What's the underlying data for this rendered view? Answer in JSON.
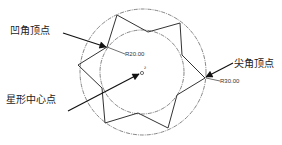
{
  "labels": {
    "concave_vertex": "凹角顶点",
    "convex_vertex": "尖角顶点",
    "star_center": "星形中心点"
  },
  "dimensions": {
    "inner_radius": "R20.00",
    "outer_radius": "R30.00"
  },
  "geometry": {
    "center": [
      142,
      72
    ],
    "outer_circle_radius_px": 63,
    "inner_circle_radius_px": 42,
    "star_points": 6,
    "line_color": "#333333",
    "circle_color": "#666666"
  }
}
